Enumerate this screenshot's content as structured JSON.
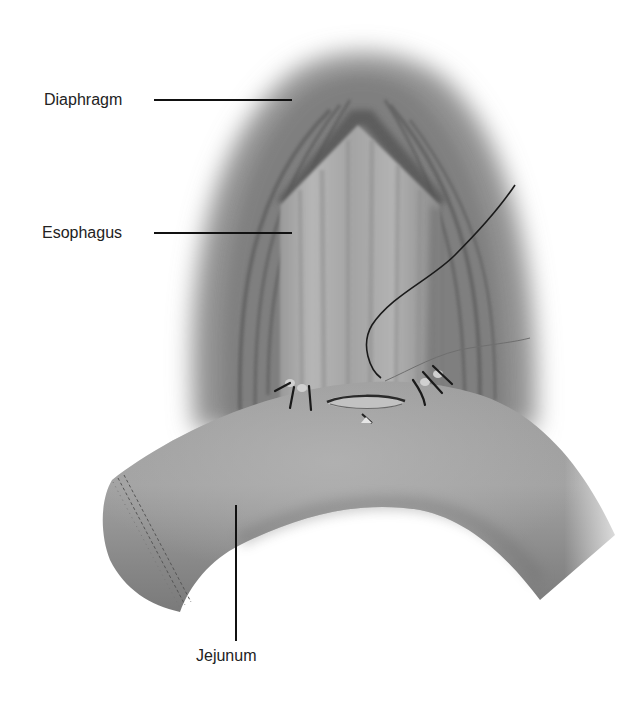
{
  "figure": {
    "type": "anatomical-illustration",
    "background": "#ffffff",
    "colors": {
      "tissue_light": "#a8a8a8",
      "tissue_mid": "#8a8a8a",
      "tissue_dark": "#5c5c5c",
      "suture": "#1a1a1a",
      "label_text": "#222222"
    }
  },
  "labels": [
    {
      "id": "diaphragm",
      "text": "Diaphragm",
      "x": 44,
      "y": 93,
      "line": {
        "x1": 154,
        "y1": 100,
        "x2": 292,
        "y2": 100
      }
    },
    {
      "id": "esophagus",
      "text": "Esophagus",
      "x": 42,
      "y": 226,
      "line": {
        "x1": 154,
        "y1": 233,
        "x2": 292,
        "y2": 233
      }
    },
    {
      "id": "jejunum",
      "text": "Jejunum",
      "x": 196,
      "y": 649,
      "line": {
        "x1": 236,
        "y1": 505,
        "x2": 236,
        "y2": 641
      }
    }
  ],
  "structures": {
    "diaphragm": {
      "description": "Hood-shaped muscular band around the esophagus, apex near (360,95)"
    },
    "esophagus": {
      "description": "Vertical tube with longitudinal striations descending to the anastomosis"
    },
    "jejunum": {
      "description": "Curved bowel loop sweeping from lower-left stapled end to lower-right"
    },
    "anastomosis": {
      "description": "Elliptical opening at approx (365,405) with interrupted sutures on both sides"
    },
    "staple_line": {
      "description": "Double row of staples on the closed jejunal stump at the left end"
    }
  },
  "sutures": {
    "left_count": 3,
    "right_count": 3,
    "running_suture_end": {
      "x": 515,
      "y": 185
    }
  }
}
